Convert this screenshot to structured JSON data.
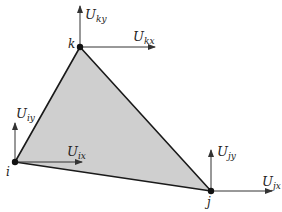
{
  "diagram": {
    "type": "triangular-element-nodal-displacements",
    "fill_color": "#cfcfcf",
    "stroke_color": "#1a1a1a",
    "arrow_color": "#333333",
    "nodes": [
      {
        "id": "k",
        "label": "k",
        "x": 80,
        "y": 47
      },
      {
        "id": "i",
        "label": "i",
        "x": 15,
        "y": 162
      },
      {
        "id": "j",
        "label": "j",
        "x": 211,
        "y": 191
      }
    ],
    "displacements": [
      {
        "node": "k",
        "dir": "y",
        "base": "U",
        "sub": "ky"
      },
      {
        "node": "k",
        "dir": "x",
        "base": "U",
        "sub": "kx"
      },
      {
        "node": "i",
        "dir": "y",
        "base": "U",
        "sub": "iy"
      },
      {
        "node": "i",
        "dir": "x",
        "base": "U",
        "sub": "ix"
      },
      {
        "node": "j",
        "dir": "y",
        "base": "U",
        "sub": "jy"
      },
      {
        "node": "j",
        "dir": "x",
        "base": "U",
        "sub": "jx"
      }
    ]
  }
}
